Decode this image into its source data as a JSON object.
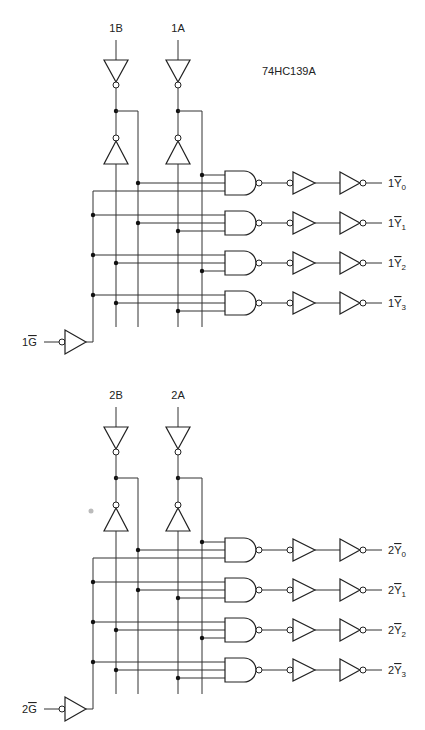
{
  "title": "74HC139A",
  "decoders": [
    {
      "id": "1",
      "offset_y": 0,
      "inputs": {
        "B": "1B",
        "A": "1A",
        "G": "1G"
      },
      "outputs": [
        "1Y0",
        "1Y1",
        "1Y2",
        "1Y3"
      ],
      "output_labels": [
        {
          "prefix": "1",
          "name": "Y",
          "sub": "0"
        },
        {
          "prefix": "1",
          "name": "Y",
          "sub": "1"
        },
        {
          "prefix": "1",
          "name": "Y",
          "sub": "2"
        },
        {
          "prefix": "1",
          "name": "Y",
          "sub": "3"
        }
      ],
      "g_label": {
        "prefix": "1",
        "name": "G"
      }
    },
    {
      "id": "2",
      "offset_y": 367,
      "inputs": {
        "B": "2B",
        "A": "2A",
        "G": "2G"
      },
      "outputs": [
        "2Y0",
        "2Y1",
        "2Y2",
        "2Y3"
      ],
      "output_labels": [
        {
          "prefix": "2",
          "name": "Y",
          "sub": "0"
        },
        {
          "prefix": "2",
          "name": "Y",
          "sub": "1"
        },
        {
          "prefix": "2",
          "name": "Y",
          "sub": "2"
        },
        {
          "prefix": "2",
          "name": "Y",
          "sub": "3"
        }
      ],
      "g_label": {
        "prefix": "2",
        "name": "G"
      }
    }
  ],
  "gate_input_map": [
    [
      "A_true",
      "B_true",
      "G"
    ],
    [
      "G",
      "B_true",
      "A_inv"
    ],
    [
      "G",
      "B_inv",
      "A_true"
    ],
    [
      "G",
      "B_inv",
      "A_inv"
    ]
  ],
  "colors": {
    "line": "#333333",
    "background": "#ffffff"
  }
}
